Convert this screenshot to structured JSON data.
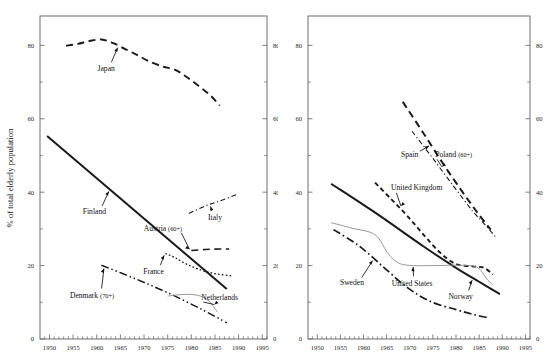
{
  "figure": {
    "ylabel": "% of total elderly population",
    "background": "#ffffff",
    "line_color": "#1a1a1a",
    "thin_line_color": "#8c8c8c",
    "axis_color": "#6f6f6f"
  },
  "axes": {
    "x_ticks": [
      "1950",
      "1955",
      "1960",
      "1965",
      "1970",
      "1975",
      "1980",
      "1985",
      "1990",
      "1995"
    ],
    "y_ticks": [
      "0",
      "20",
      "40",
      "60",
      "80"
    ],
    "y_minor": [
      10,
      30,
      50,
      70
    ],
    "xlim": [
      1948,
      1996
    ],
    "ylim": [
      0,
      88
    ]
  },
  "chart_data": [
    {
      "type": "line",
      "panel": "left",
      "title": "",
      "xlabel": "",
      "ylabel": "% of total elderly population",
      "xlim": [
        1948,
        1996
      ],
      "ylim": [
        0,
        88
      ],
      "grid": false,
      "legend": "inline-annotations",
      "x_ticks": [
        1950,
        1955,
        1960,
        1965,
        1970,
        1975,
        1980,
        1985,
        1990,
        1995
      ],
      "y_ticks": [
        0,
        20,
        40,
        60,
        80
      ],
      "series": [
        {
          "name": "Japan",
          "style": "dashed",
          "width": 1.9,
          "color": "#1a1a1a",
          "label_x": 1962.0,
          "label_y": 73.0,
          "points": [
            {
              "x": 1953.5,
              "y": 79.9
            },
            {
              "x": 1956.0,
              "y": 80.4
            },
            {
              "x": 1958.5,
              "y": 81.2
            },
            {
              "x": 1961.0,
              "y": 81.6
            },
            {
              "x": 1963.5,
              "y": 80.6
            },
            {
              "x": 1966.0,
              "y": 79.0
            },
            {
              "x": 1968.5,
              "y": 77.4
            },
            {
              "x": 1971.0,
              "y": 75.7
            },
            {
              "x": 1974.0,
              "y": 74.2
            },
            {
              "x": 1976.5,
              "y": 73.4
            },
            {
              "x": 1979.0,
              "y": 71.4
            },
            {
              "x": 1981.5,
              "y": 69.0
            },
            {
              "x": 1984.0,
              "y": 66.4
            },
            {
              "x": 1986.0,
              "y": 63.6
            }
          ]
        },
        {
          "name": "Finland",
          "style": "solid",
          "width": 2.0,
          "color": "#1a1a1a",
          "label_x": 1959.5,
          "label_y": 34.0,
          "points": [
            {
              "x": 1949.5,
              "y": 55.3
            },
            {
              "x": 1987.5,
              "y": 13.6
            }
          ]
        },
        {
          "name": "Italy",
          "style": "dashdot-fine",
          "width": 1.1,
          "color": "#1a1a1a",
          "label_x": 1985.0,
          "label_y": 32.4,
          "points": [
            {
              "x": 1979.5,
              "y": 34.2
            },
            {
              "x": 1983.0,
              "y": 36.3
            },
            {
              "x": 1986.0,
              "y": 37.6
            },
            {
              "x": 1989.5,
              "y": 39.3
            }
          ]
        },
        {
          "name": "Austria (60+)",
          "style": "dashed",
          "width": 1.6,
          "color": "#1a1a1a",
          "label_x": 1974.0,
          "label_y": 29.3,
          "points": [
            {
              "x": 1980.0,
              "y": 24.1
            },
            {
              "x": 1983.0,
              "y": 24.4
            },
            {
              "x": 1986.0,
              "y": 24.5
            },
            {
              "x": 1988.0,
              "y": 24.5
            }
          ]
        },
        {
          "name": "France",
          "style": "dotted",
          "width": 1.3,
          "color": "#1a1a1a",
          "label_x": 1972.0,
          "label_y": 17.8,
          "points": [
            {
              "x": 1974.5,
              "y": 23.3
            },
            {
              "x": 1976.5,
              "y": 22.2
            },
            {
              "x": 1979.0,
              "y": 20.4
            },
            {
              "x": 1982.0,
              "y": 18.8
            },
            {
              "x": 1985.0,
              "y": 17.8
            },
            {
              "x": 1988.5,
              "y": 17.2
            }
          ]
        },
        {
          "name": "Denmark (70+)",
          "style": "dashdotdot",
          "width": 1.5,
          "color": "#1a1a1a",
          "label_x": 1959.0,
          "label_y": 11.3,
          "points": [
            {
              "x": 1961.0,
              "y": 20.1
            },
            {
              "x": 1968.0,
              "y": 16.5
            },
            {
              "x": 1975.0,
              "y": 12.6
            },
            {
              "x": 1982.0,
              "y": 8.2
            },
            {
              "x": 1987.5,
              "y": 4.4
            }
          ]
        },
        {
          "name": "Netherlands",
          "style": "solid-thin",
          "width": 0.9,
          "color": "#8c8c8c",
          "label_x": 1986.0,
          "label_y": 10.6,
          "points": [
            {
              "x": 1975.0,
              "y": 11.7
            },
            {
              "x": 1978.0,
              "y": 12.1
            },
            {
              "x": 1981.0,
              "y": 12.0
            },
            {
              "x": 1983.5,
              "y": 10.6
            },
            {
              "x": 1985.5,
              "y": 7.4
            }
          ]
        }
      ]
    },
    {
      "type": "line",
      "panel": "right",
      "title": "",
      "xlabel": "",
      "ylabel": "",
      "xlim": [
        1948,
        1996
      ],
      "ylim": [
        0,
        88
      ],
      "grid": false,
      "legend": "inline-annotations",
      "x_ticks": [
        1950,
        1955,
        1960,
        1965,
        1970,
        1975,
        1980,
        1985,
        1990,
        1995
      ],
      "y_ticks": [
        0,
        20,
        40,
        60,
        80
      ],
      "series": [
        {
          "name": "Spain",
          "style": "dashed",
          "width": 2.0,
          "color": "#1a1a1a",
          "label_x": 1970.0,
          "label_y": 49.5,
          "points": [
            {
              "x": 1968.5,
              "y": 64.6
            },
            {
              "x": 1973.0,
              "y": 56.0
            },
            {
              "x": 1977.5,
              "y": 47.2
            },
            {
              "x": 1982.0,
              "y": 39.0
            },
            {
              "x": 1985.0,
              "y": 33.8
            },
            {
              "x": 1987.5,
              "y": 29.8
            }
          ]
        },
        {
          "name": "Poland (60+)",
          "style": "dashdot-fine",
          "width": 1.1,
          "color": "#1a1a1a",
          "label_x": 1979.5,
          "label_y": 49.5,
          "points": [
            {
              "x": 1970.5,
              "y": 56.6
            },
            {
              "x": 1975.0,
              "y": 49.2
            },
            {
              "x": 1979.5,
              "y": 41.6
            },
            {
              "x": 1983.5,
              "y": 35.0
            },
            {
              "x": 1986.5,
              "y": 30.8
            },
            {
              "x": 1988.5,
              "y": 27.9
            }
          ]
        },
        {
          "name": "United Kingdom",
          "style": "dashed-short",
          "width": 1.9,
          "color": "#1a1a1a",
          "label_x": 1971.5,
          "label_y": 40.5,
          "points": [
            {
              "x": 1962.5,
              "y": 42.6
            },
            {
              "x": 1966.0,
              "y": 38.1
            },
            {
              "x": 1969.5,
              "y": 33.5
            },
            {
              "x": 1973.0,
              "y": 28.4
            },
            {
              "x": 1976.5,
              "y": 23.6
            },
            {
              "x": 1980.0,
              "y": 20.4
            },
            {
              "x": 1983.5,
              "y": 19.8
            },
            {
              "x": 1986.0,
              "y": 19.4
            },
            {
              "x": 1988.0,
              "y": 17.6
            }
          ]
        },
        {
          "name": "Norway",
          "style": "solid",
          "width": 2.0,
          "color": "#1a1a1a",
          "label_x": 1981.0,
          "label_y": 10.9,
          "points": [
            {
              "x": 1953.0,
              "y": 42.3
            },
            {
              "x": 1963.0,
              "y": 34.0
            },
            {
              "x": 1973.0,
              "y": 25.2
            },
            {
              "x": 1980.0,
              "y": 19.4
            },
            {
              "x": 1985.0,
              "y": 15.6
            },
            {
              "x": 1989.5,
              "y": 12.2
            }
          ]
        },
        {
          "name": "United States",
          "style": "solid-thin",
          "width": 0.9,
          "color": "#8c8c8c",
          "label_x": 1970.5,
          "label_y": 14.5,
          "points": [
            {
              "x": 1953.0,
              "y": 31.7
            },
            {
              "x": 1957.5,
              "y": 30.2
            },
            {
              "x": 1962.5,
              "y": 28.4
            },
            {
              "x": 1965.5,
              "y": 23.0
            },
            {
              "x": 1968.5,
              "y": 20.3
            },
            {
              "x": 1975.0,
              "y": 20.0
            },
            {
              "x": 1980.0,
              "y": 20.1
            },
            {
              "x": 1984.5,
              "y": 19.6
            },
            {
              "x": 1986.5,
              "y": 16.6
            },
            {
              "x": 1988.0,
              "y": 14.6
            }
          ]
        },
        {
          "name": "Sweden",
          "style": "dashdot",
          "width": 1.7,
          "color": "#1a1a1a",
          "label_x": 1957.5,
          "label_y": 14.6,
          "points": [
            {
              "x": 1953.5,
              "y": 29.8
            },
            {
              "x": 1959.0,
              "y": 25.4
            },
            {
              "x": 1964.5,
              "y": 19.4
            },
            {
              "x": 1969.5,
              "y": 14.0
            },
            {
              "x": 1974.5,
              "y": 10.2
            },
            {
              "x": 1980.0,
              "y": 8.0
            },
            {
              "x": 1984.0,
              "y": 6.6
            },
            {
              "x": 1987.0,
              "y": 5.8
            }
          ]
        }
      ]
    }
  ],
  "annotations": {
    "left": [
      {
        "name": "Japan",
        "text": "Japan",
        "sub": ""
      },
      {
        "name": "Finland",
        "text": "Finland",
        "sub": ""
      },
      {
        "name": "Italy",
        "text": "Italy",
        "sub": ""
      },
      {
        "name": "Austria",
        "text": "Austria ",
        "sub": "(60+)"
      },
      {
        "name": "France",
        "text": "France",
        "sub": ""
      },
      {
        "name": "Denmark",
        "text": "Denmark ",
        "sub": "(70+)"
      },
      {
        "name": "Netherlands",
        "text": "Netherlands",
        "sub": ""
      }
    ],
    "right": [
      {
        "name": "Spain",
        "text": "Spain",
        "sub": ""
      },
      {
        "name": "Poland",
        "text": "Poland ",
        "sub": "(60+)"
      },
      {
        "name": "UnitedKingdom",
        "text": "United Kingdom",
        "sub": ""
      },
      {
        "name": "Norway",
        "text": "Norway",
        "sub": ""
      },
      {
        "name": "UnitedStates",
        "text": "United States",
        "sub": ""
      },
      {
        "name": "Sweden",
        "text": "Sweden",
        "sub": ""
      }
    ]
  }
}
